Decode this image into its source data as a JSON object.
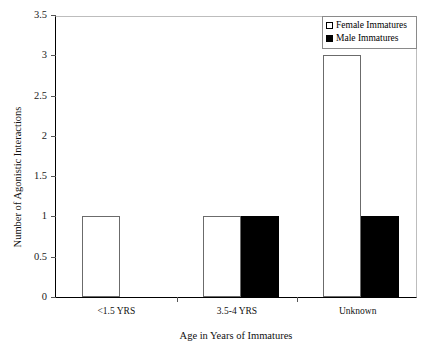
{
  "chart_data": {
    "type": "bar",
    "title": "",
    "xlabel": "Age in Years of Immatures",
    "ylabel": "Number of Agonistic Interactions",
    "categories": [
      "<1.5 YRS",
      "3.5-4 YRS",
      "Unknown"
    ],
    "series": [
      {
        "name": "Female Immatures",
        "values": [
          1,
          1,
          3
        ],
        "color": "#ffffff"
      },
      {
        "name": "Male Immatures",
        "values": [
          0,
          1,
          1
        ],
        "color": "#000000"
      }
    ],
    "ylim": [
      0,
      3.5
    ],
    "yticks": [
      "0",
      "0.5",
      "1",
      "1.5",
      "2",
      "2.5",
      "3",
      "3.5"
    ],
    "ytick_values": [
      0,
      0.5,
      1,
      1.5,
      2,
      2.5,
      3,
      3.5
    ],
    "grid": false,
    "legend_position": "top-right"
  },
  "legend": {
    "entries": [
      {
        "label": "Female Immatures",
        "swatch": "open-square-swatch"
      },
      {
        "label": "Male Immatures",
        "swatch": "filled-square-swatch"
      }
    ]
  },
  "axes": {
    "y_title": "Number of Agonistic Interactions",
    "x_title": "Age in Years of Immatures"
  }
}
